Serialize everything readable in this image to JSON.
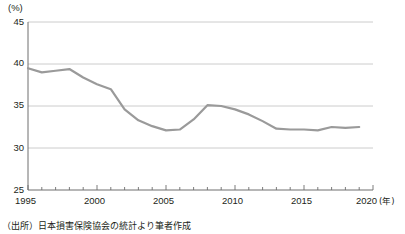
{
  "chart_data": {
    "type": "line",
    "title": "",
    "subtitle": "",
    "xlabel": "年",
    "ylabel": "(%)",
    "unit_label": "(%)",
    "xlim": [
      1995,
      2020
    ],
    "ylim": [
      25,
      45
    ],
    "ytick_labels": [
      "45",
      "40",
      "35",
      "30",
      "25"
    ],
    "ytick_values": [
      45,
      40,
      35,
      30,
      25
    ],
    "xtick_labels": [
      "1995",
      "2000",
      "2005",
      "2010",
      "2015",
      "2020"
    ],
    "xtick_values": [
      1995,
      2000,
      2005,
      2010,
      2015,
      2020
    ],
    "xaxis_unit_suffix": "(年)",
    "minor_ticks": "every 1 year",
    "grid": "horizontal gridlines at 45, 40, 35, 30",
    "legend": "none",
    "line_color": "#9a9a9a",
    "line_width": 2.2,
    "series": [
      {
        "name": "割合",
        "x": [
          1995,
          1996,
          1997,
          1998,
          1999,
          2000,
          2001,
          2002,
          2003,
          2004,
          2005,
          2006,
          2007,
          2008,
          2009,
          2010,
          2011,
          2012,
          2013,
          2014,
          2015,
          2016,
          2017,
          2018,
          2019
        ],
        "values": [
          39.5,
          39.0,
          39.2,
          39.4,
          38.4,
          37.6,
          37.0,
          34.6,
          33.3,
          32.6,
          32.1,
          32.2,
          33.4,
          35.1,
          35.0,
          34.6,
          34.0,
          33.2,
          32.3,
          32.2,
          32.2,
          32.1,
          32.5,
          32.4,
          32.5
        ]
      }
    ],
    "annotations": []
  },
  "notes": {
    "source": "（出所）日本損害保険協会の統計より筆者作成"
  }
}
